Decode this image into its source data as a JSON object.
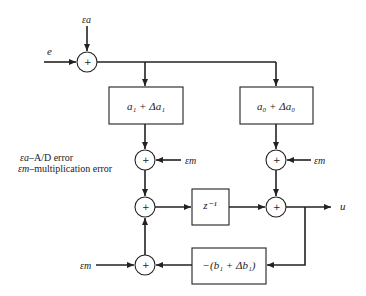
{
  "diagram": {
    "type": "block-diagram",
    "inputs": {
      "e": "e",
      "eps_a": "εa",
      "eps_m": "εm"
    },
    "output": "u",
    "blocks": [
      {
        "id": "a1",
        "label": "a₁ + Δa₁"
      },
      {
        "id": "a0",
        "label": "a₀ + Δa₀"
      },
      {
        "id": "delay",
        "label": "z⁻¹"
      },
      {
        "id": "b1",
        "label": "−(b₁ + Δb₁)"
      }
    ],
    "summers": [
      {
        "id": "s-input",
        "sign": "+"
      },
      {
        "id": "s-a1-err",
        "sign": "+"
      },
      {
        "id": "s-a0-err",
        "sign": "+"
      },
      {
        "id": "s-mid-left",
        "sign": "+"
      },
      {
        "id": "s-mid-right",
        "sign": "+"
      },
      {
        "id": "s-feedback",
        "sign": "+"
      }
    ],
    "legend": [
      {
        "symbol": "εa",
        "text": "–A/D error"
      },
      {
        "symbol": "εm",
        "text": "–multiplication error"
      }
    ]
  }
}
